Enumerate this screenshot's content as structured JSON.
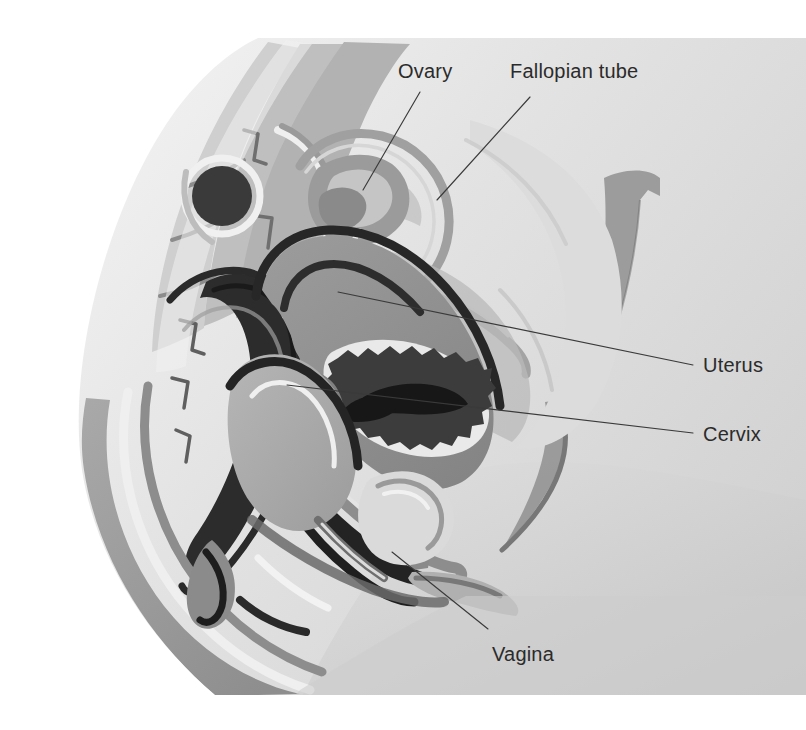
{
  "figure": {
    "type": "anatomical-illustration",
    "background_color": "#ffffff",
    "canvas": {
      "width": 806,
      "height": 730
    }
  },
  "labels": [
    {
      "id": "ovary",
      "text": "Ovary",
      "text_x": 398,
      "text_y": 78,
      "leader": {
        "x1": 420,
        "y1": 92,
        "x2": 363,
        "y2": 190
      }
    },
    {
      "id": "fallopian-tube",
      "text": "Fallopian tube",
      "text_x": 510,
      "text_y": 78,
      "leader": {
        "x1": 530,
        "y1": 97,
        "x2": 437,
        "y2": 200
      }
    },
    {
      "id": "uterus",
      "text": "Uterus",
      "text_x": 703,
      "text_y": 372,
      "leader": {
        "x1": 693,
        "y1": 365,
        "x2": 338,
        "y2": 292
      }
    },
    {
      "id": "cervix",
      "text": "Cervix",
      "text_x": 703,
      "text_y": 441,
      "leader": {
        "x1": 693,
        "y1": 433,
        "x2": 287,
        "y2": 385
      }
    },
    {
      "id": "vagina",
      "text": "Vagina",
      "text_x": 492,
      "text_y": 661,
      "leader": {
        "x1": 488,
        "y1": 629,
        "x2": 392,
        "y2": 552
      }
    }
  ],
  "palette": {
    "paper": "#ffffff",
    "body_light": "#e8e8e8",
    "body_mid_light": "#d9d9d9",
    "tissue_light": "#cfcfcf",
    "tissue_mid": "#b4b4b4",
    "tissue_mid_dark": "#9a9a9a",
    "muscle": "#858585",
    "organ_dark": "#6d6d6d",
    "cavity_dark": "#4a4a4a",
    "deep_dark": "#2e2e2e",
    "outline": "#1c1c1c",
    "highlight": "#f2f2f2",
    "label_ink": "#2b2b2b"
  },
  "structures": [
    {
      "name": "abdominal-wall",
      "tone": "#e4e4e4"
    },
    {
      "name": "sacrum-spine",
      "tone": "#cccccc"
    },
    {
      "name": "rectum",
      "tone": "#2e2e2e"
    },
    {
      "name": "bladder",
      "tone": "#a8a8a8"
    },
    {
      "name": "uterus-body",
      "tone": "#8d8d8d"
    },
    {
      "name": "endometrial-cavity",
      "tone": "#2a2a2a"
    },
    {
      "name": "cervix",
      "tone": "#7a7a7a"
    },
    {
      "name": "vaginal-canal",
      "tone": "#2e2e2e"
    },
    {
      "name": "ovary",
      "tone": "#8f8f8f"
    },
    {
      "name": "fallopian-tube",
      "tone": "#9e9e9e"
    },
    {
      "name": "pubic-symphysis",
      "tone": "#bcbcbc"
    },
    {
      "name": "gluteal-muscle",
      "tone": "#9d9d9d"
    },
    {
      "name": "thigh",
      "tone": "#d2d2d2"
    },
    {
      "name": "abdominal-muscle-band",
      "tone": "#a6a6a6"
    }
  ]
}
